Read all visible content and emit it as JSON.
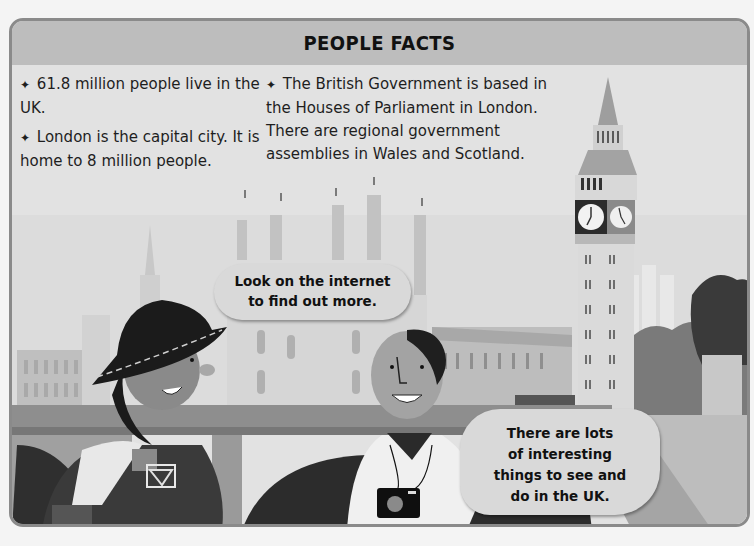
{
  "header": {
    "title": "PEOPLE FACTS"
  },
  "facts": {
    "bullet_icon": "✦",
    "left": [
      {
        "text": "61.8 million people live in the UK."
      },
      {
        "text": "London is the capital city. It is home to 8 million people."
      }
    ],
    "right": [
      {
        "text": "The British Government is based in the Houses of Parliament in London. There are regional government assemblies in Wales and Scotland."
      }
    ]
  },
  "bubbles": {
    "top": {
      "line1": "Look on the internet",
      "line2": "to find out more."
    },
    "bottom": {
      "line1": "There are lots",
      "line2": "of interesting",
      "line3": "things to see and",
      "line4": "do in the UK."
    }
  },
  "illustration": {
    "description": "Westminster skyline with Big Ben, Houses of Parliament, bridge, and two tourists",
    "elements": [
      "big-ben-clock-tower",
      "houses-of-parliament",
      "westminster-bridge",
      "double-decker-bus",
      "girl-with-hat",
      "boy-with-camera",
      "trees"
    ]
  },
  "colors": {
    "header_bg": "#bdbdbd",
    "frame_border": "#8a8a8a",
    "sky": "#e2e2e2",
    "bubble_bg": "#d9d9d9",
    "text": "#1e1e1e"
  }
}
